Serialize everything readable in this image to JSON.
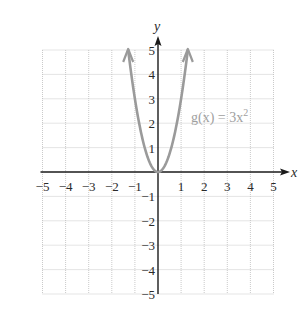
{
  "chart_data": {
    "type": "line",
    "title": "",
    "xlabel": "x",
    "ylabel": "y",
    "xlim": [
      -5,
      5
    ],
    "ylim": [
      -5,
      5
    ],
    "grid": true,
    "x_ticks": [
      "-5",
      "-4",
      "-3",
      "-2",
      "-1",
      "1",
      "2",
      "3",
      "4",
      "5"
    ],
    "y_ticks": [
      "5",
      "4",
      "3",
      "2",
      "1",
      "-1",
      "-2",
      "-3",
      "-4",
      "-5"
    ],
    "series": [
      {
        "name": "g(x) = 3x^2",
        "function": "3x^2",
        "x": [
          -1.29,
          -1,
          -0.5,
          0,
          0.5,
          1,
          1.29
        ],
        "y": [
          5,
          3,
          0.75,
          0,
          0.75,
          3,
          5
        ],
        "color": "#9a9a9a",
        "arrows_at_ends": true
      }
    ],
    "annotations": [
      {
        "text": "g(x) = 3x",
        "superscript": "2",
        "x": 1.4,
        "y": 2.4
      }
    ]
  },
  "labels": {
    "x_axis": "x",
    "y_axis": "y",
    "function_main": "g(x) = 3x",
    "function_sup": "2"
  },
  "colors": {
    "curve": "#9a9a9a",
    "axis": "#1a1a1a",
    "grid": "#bdbdbd"
  }
}
